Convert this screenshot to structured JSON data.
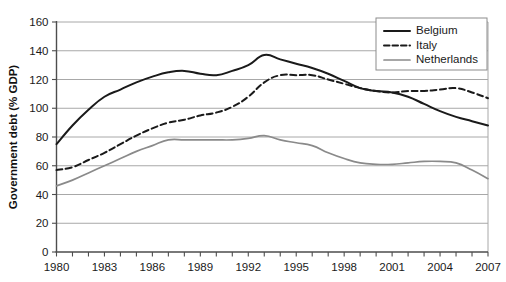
{
  "chart_data": {
    "type": "line",
    "title": "",
    "xlabel": "",
    "ylabel": "Government debt (% GDP)",
    "xlim": [
      1980,
      2007
    ],
    "ylim": [
      0,
      160
    ],
    "ytick_step": 20,
    "yticks": [
      0,
      20,
      40,
      60,
      80,
      100,
      120,
      140,
      160
    ],
    "xticks": [
      1980,
      1981,
      1982,
      1983,
      1984,
      1985,
      1986,
      1987,
      1988,
      1989,
      1990,
      1991,
      1992,
      1993,
      1994,
      1995,
      1996,
      1997,
      1998,
      1999,
      2000,
      2001,
      2002,
      2003,
      2004,
      2005,
      2006,
      2007
    ],
    "xtick_labels": [
      "1980",
      "1983",
      "1986",
      "1989",
      "1992",
      "1995",
      "1998",
      "2001",
      "2004",
      "2007"
    ],
    "xtick_labeled_values": [
      1980,
      1983,
      1986,
      1989,
      1992,
      1995,
      1998,
      2001,
      2004,
      2007
    ],
    "grid": "horizontal",
    "legend_position": "top-right",
    "x": [
      1980,
      1981,
      1982,
      1983,
      1984,
      1985,
      1986,
      1987,
      1988,
      1989,
      1990,
      1991,
      1992,
      1993,
      1994,
      1995,
      1996,
      1997,
      1998,
      1999,
      2000,
      2001,
      2002,
      2003,
      2004,
      2005,
      2006,
      2007
    ],
    "series": [
      {
        "name": "Belgium",
        "style": "solid",
        "color": "#1a1a1a",
        "width": 2.0,
        "values": [
          75,
          88,
          99,
          108,
          113,
          118,
          122,
          125,
          126,
          124,
          123,
          126,
          130,
          137,
          134,
          131,
          128,
          124,
          119,
          114,
          112,
          111,
          108,
          103,
          98,
          94,
          91,
          88
        ]
      },
      {
        "name": "Italy",
        "style": "dashed",
        "color": "#1a1a1a",
        "width": 2.0,
        "values": [
          57,
          59,
          64,
          69,
          75,
          81,
          86,
          90,
          92,
          95,
          97,
          101,
          108,
          118,
          123,
          123,
          123,
          120,
          117,
          114,
          112,
          111,
          112,
          112,
          113,
          114,
          111,
          107
        ]
      },
      {
        "name": "Netherlands",
        "style": "solid",
        "color": "#8a8a8a",
        "width": 1.7,
        "values": [
          46,
          50,
          55,
          60,
          65,
          70,
          74,
          78,
          78,
          78,
          78,
          78,
          79,
          81,
          78,
          76,
          74,
          69,
          65,
          62,
          61,
          61,
          62,
          63,
          63,
          62,
          57,
          51
        ]
      }
    ]
  },
  "legend": {
    "entries": [
      {
        "label": "Belgium"
      },
      {
        "label": "Italy"
      },
      {
        "label": "Netherlands"
      }
    ]
  },
  "axes": {
    "y_title": "Government debt (% GDP)"
  }
}
